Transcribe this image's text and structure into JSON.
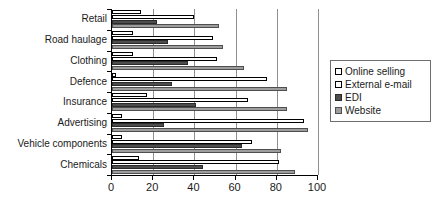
{
  "chart_data": {
    "type": "bar",
    "orientation": "horizontal",
    "title": "",
    "xlabel": "",
    "ylabel": "",
    "xlim": [
      0,
      100
    ],
    "xticks": [
      0,
      20,
      40,
      60,
      80,
      100
    ],
    "xtick_labels": [
      "0",
      "20",
      "40",
      "60",
      "80",
      "100"
    ],
    "grid": "vertical",
    "legend_position": "right",
    "categories": [
      "Retail",
      "Road haulage",
      "Clothing",
      "Defence",
      "Insurance",
      "Advertising",
      "Vehicle components",
      "Chemicals"
    ],
    "series": [
      {
        "name": "Online selling",
        "color": "#ffffff",
        "values": [
          14,
          10,
          10,
          2,
          17,
          5,
          5,
          13
        ]
      },
      {
        "name": "External e-mail",
        "color": "#ffffff",
        "values": [
          40,
          49,
          51,
          75,
          66,
          93,
          68,
          81
        ]
      },
      {
        "name": "EDI",
        "color": "#4d4d4d",
        "values": [
          22,
          27,
          37,
          29,
          41,
          25,
          63,
          44
        ]
      },
      {
        "name": "Website",
        "color": "#9d9d9d",
        "values": [
          52,
          54,
          64,
          85,
          85,
          95,
          82,
          89
        ]
      }
    ]
  },
  "legend": {
    "items": [
      {
        "label": "Online selling"
      },
      {
        "label": "External e-mail"
      },
      {
        "label": "EDI"
      },
      {
        "label": "Website"
      }
    ]
  }
}
